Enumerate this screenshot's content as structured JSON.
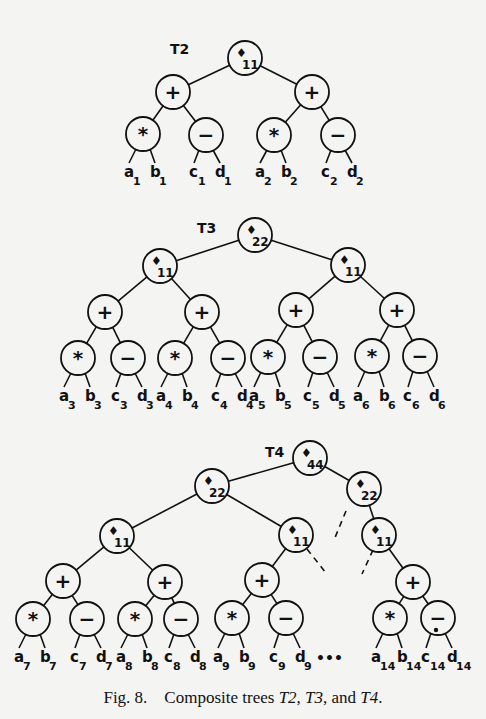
{
  "figure": {
    "caption": {
      "prefix": "Fig. 8.",
      "text_before": "Composite trees ",
      "t2": "T2",
      "sep1": ", ",
      "t3": "T3",
      "sep2": ", and ",
      "t4": "T4",
      "end": "."
    },
    "trees": [
      {
        "label": "T2",
        "root": {
          "op": "φ",
          "index": "11"
        },
        "subtrees": [
          {
            "op": "+",
            "children": [
              {
                "op": "*",
                "leaves": [
                  "a1",
                  "b1"
                ]
              },
              {
                "op": "−",
                "leaves": [
                  "c1",
                  "d1"
                ]
              }
            ]
          },
          {
            "op": "+",
            "children": [
              {
                "op": "*",
                "leaves": [
                  "a2",
                  "b2"
                ]
              },
              {
                "op": "−",
                "leaves": [
                  "c2",
                  "d2"
                ]
              }
            ]
          }
        ]
      },
      {
        "label": "T3",
        "root": {
          "op": "φ",
          "index": "22"
        },
        "children": [
          "φ11",
          "φ11"
        ],
        "leaf_groups": [
          "3",
          "4",
          "5",
          "6"
        ]
      },
      {
        "label": "T4",
        "root": {
          "op": "φ",
          "index": "44"
        },
        "children": [
          "φ22",
          "φ22"
        ],
        "grandchildren": [
          "φ11",
          "φ11",
          "φ11"
        ],
        "leaf_groups": [
          "7",
          "8",
          "9",
          "14"
        ],
        "ellipsis": "•••"
      }
    ]
  },
  "nodes": {
    "phi_symbol": "♦",
    "plus": "+",
    "times": "*",
    "minus": "−"
  }
}
